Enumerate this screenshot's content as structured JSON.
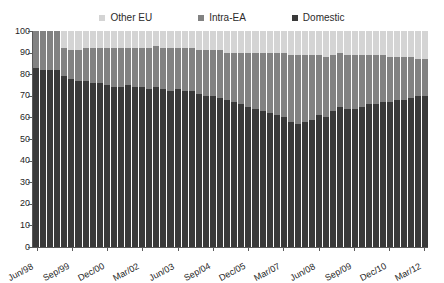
{
  "chart_data": {
    "type": "bar",
    "subtype": "100% stacked column",
    "title": "",
    "xlabel": "",
    "ylabel": "",
    "ylim": [
      0,
      100
    ],
    "ytick_step": 10,
    "ytick_labels": [
      "100",
      "90",
      "80",
      "70",
      "60",
      "50",
      "40",
      "30",
      "20",
      "10",
      "0"
    ],
    "grid": false,
    "legend_position": "top-center",
    "legend": [
      "Other EU",
      "Intra-EA",
      "Domestic"
    ],
    "stack_order_bottom_to_top": [
      "Domestic",
      "Intra-EA",
      "Other EU"
    ],
    "colors": {
      "Domestic": "#3a3a3a",
      "Intra-EA": "#828282",
      "Other EU": "#d4d4d4",
      "axis": "#5a5a5a",
      "background": "#ffffff",
      "text": "#1f1f1f"
    },
    "x": [
      "Jun/98",
      "Sep/98",
      "Dec/98",
      "Mar/99",
      "Jun/99",
      "Sep/99",
      "Dec/99",
      "Mar/00",
      "Jun/00",
      "Sep/00",
      "Dec/00",
      "Mar/01",
      "Jun/01",
      "Sep/01",
      "Dec/01",
      "Mar/02",
      "Jun/02",
      "Sep/02",
      "Dec/02",
      "Mar/03",
      "Jun/03",
      "Sep/03",
      "Dec/03",
      "Mar/04",
      "Jun/04",
      "Sep/04",
      "Dec/04",
      "Mar/05",
      "Jun/05",
      "Sep/05",
      "Dec/05",
      "Mar/06",
      "Jun/06",
      "Sep/06",
      "Dec/06",
      "Mar/07",
      "Jun/07",
      "Sep/07",
      "Dec/07",
      "Mar/08",
      "Jun/08",
      "Sep/08",
      "Dec/08",
      "Mar/09",
      "Jun/09",
      "Sep/09",
      "Dec/09",
      "Mar/10",
      "Jun/10",
      "Sep/10",
      "Dec/10",
      "Mar/11",
      "Jun/11",
      "Sep/11",
      "Dec/11",
      "Mar/12"
    ],
    "xtick_labels_shown": [
      "Jun/98",
      "Sep/99",
      "Dec/00",
      "Mar/02",
      "Jun/03",
      "Sep/04",
      "Dec/05",
      "Mar/07",
      "Jun/08",
      "Sep/09",
      "Dec/10",
      "Mar/12"
    ],
    "xtick_label_interval": 5,
    "series": [
      {
        "name": "Domestic",
        "color": "#3a3a3a",
        "values": [
          83,
          82,
          82,
          82,
          79,
          78,
          77,
          77,
          76,
          76,
          75,
          74,
          74,
          75,
          74,
          74,
          73,
          74,
          73,
          72,
          73,
          72,
          72,
          71,
          70,
          70,
          69,
          68,
          67,
          66,
          65,
          64,
          63,
          62,
          61,
          60,
          58,
          57,
          58,
          59,
          61,
          60,
          63,
          65,
          64,
          64,
          65,
          66,
          66,
          67,
          67,
          68,
          68,
          69,
          70,
          70
        ]
      },
      {
        "name": "Intra-EA",
        "color": "#828282",
        "values": [
          17,
          18,
          18,
          18,
          13,
          13,
          14,
          15,
          16,
          16,
          17,
          18,
          18,
          17,
          18,
          18,
          19,
          19,
          19,
          20,
          19,
          20,
          20,
          20,
          21,
          21,
          22,
          22,
          23,
          24,
          25,
          26,
          27,
          28,
          29,
          30,
          31,
          32,
          31,
          30,
          28,
          28,
          26,
          25,
          25,
          25,
          24,
          23,
          23,
          22,
          21,
          20,
          20,
          19,
          17,
          17
        ]
      },
      {
        "name": "Other EU",
        "color": "#d4d4d4",
        "values": [
          0,
          0,
          0,
          0,
          8,
          9,
          9,
          8,
          8,
          8,
          8,
          8,
          8,
          8,
          8,
          8,
          8,
          7,
          8,
          8,
          8,
          8,
          8,
          9,
          9,
          9,
          9,
          10,
          10,
          10,
          10,
          10,
          10,
          10,
          10,
          10,
          11,
          11,
          11,
          11,
          11,
          12,
          11,
          10,
          11,
          11,
          11,
          11,
          11,
          11,
          12,
          12,
          12,
          12,
          13,
          13
        ]
      }
    ]
  }
}
